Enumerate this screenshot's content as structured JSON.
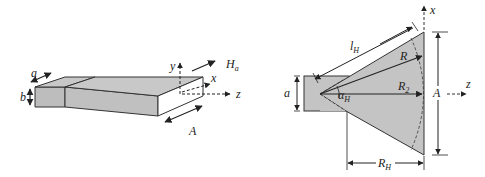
{
  "figure": {
    "left_view": {
      "labels": {
        "a": "a",
        "b": "b",
        "y": "y",
        "x": "x",
        "z": "z",
        "Ha_main": "H",
        "Ha_sub": "a",
        "A": "A"
      }
    },
    "right_view": {
      "labels": {
        "x": "x",
        "z": "z",
        "a": "a",
        "A": "A",
        "lH_main": "l",
        "lH_sub": "H",
        "R": "R",
        "R2_main": "R",
        "R2_sub": "2",
        "alpha_main": "α",
        "alpha_sub": "H",
        "RH_main": "R",
        "RH_sub": "H"
      }
    },
    "colors": {
      "fill": "#c4c4c4",
      "stroke": "#222222",
      "background": "#ffffff"
    }
  }
}
